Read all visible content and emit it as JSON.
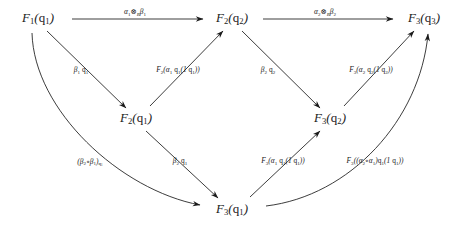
{
  "diagram": {
    "type": "commutative-diagram",
    "background_color": "#ffffff",
    "ink_color": "#1a1a1a",
    "nodes": [
      {
        "id": "n-f1q1",
        "label": "F₁(q₁)",
        "x": 38,
        "y": 18,
        "row": "top"
      },
      {
        "id": "n-f2q2",
        "label": "F₂(q₂)",
        "x": 232,
        "y": 18,
        "row": "top"
      },
      {
        "id": "n-f3q3",
        "label": "F₃(q₃)",
        "x": 424,
        "y": 18,
        "row": "top"
      },
      {
        "id": "n-f2q1",
        "label": "F₂(q₁)",
        "x": 136,
        "y": 118,
        "row": "middle"
      },
      {
        "id": "n-f3q2",
        "label": "F₃(q₂)",
        "x": 330,
        "y": 118,
        "row": "middle"
      },
      {
        "id": "n-f3q1",
        "label": "F₃(q₁)",
        "x": 232,
        "y": 209,
        "row": "bottom"
      }
    ],
    "arrows": [
      {
        "id": "a-top-left",
        "from": "F₁(q₁)",
        "to": "F₂(q₂)",
        "label": "α₁⊗ₘβ₁",
        "label_x": 135,
        "label_y": 12,
        "shape": "straight-horizontal"
      },
      {
        "id": "a-top-right",
        "from": "F₂(q₂)",
        "to": "F₃(q₃)",
        "label": "α₂⊗ₘβ₂",
        "label_x": 325,
        "label_y": 12,
        "shape": "straight-horizontal"
      },
      {
        "id": "a-f1q1-f2q1",
        "from": "F₁(q₁)",
        "to": "F₂(q₁)",
        "label": "β₁ q₁",
        "label_x": 81,
        "label_y": 70,
        "shape": "straight-diagonal"
      },
      {
        "id": "a-f2q1-f2q2",
        "from": "F₂(q₁)",
        "to": "F₂(q₂)",
        "label": "F₂(α₁ q₁(1 q₁))",
        "label_x": 178,
        "label_y": 70,
        "shape": "straight-diagonal"
      },
      {
        "id": "a-f2q2-f3q2",
        "from": "F₂(q₂)",
        "to": "F₃(q₂)",
        "label": "β₂ q₂",
        "label_x": 268,
        "label_y": 70,
        "shape": "straight-diagonal"
      },
      {
        "id": "a-f3q2-f3q3",
        "from": "F₃(q₂)",
        "to": "F₃(q₃)",
        "label": "F₃(α₂ q₂(1 q₂))",
        "label_x": 371,
        "label_y": 70,
        "shape": "straight-diagonal"
      },
      {
        "id": "a-f1q1-f3q1",
        "from": "F₁(q₁)",
        "to": "F₃(q₁)",
        "label": "(β₂∘β₁) q₁",
        "label_x": 90,
        "label_y": 162,
        "shape": "curve"
      },
      {
        "id": "a-f2q1-f3q1",
        "from": "F₂(q₁)",
        "to": "F₃(q₁)",
        "label": "β₂ q₁",
        "label_x": 180,
        "label_y": 161,
        "shape": "straight-diagonal"
      },
      {
        "id": "a-f3q1-f3q2",
        "from": "F₃(q₁)",
        "to": "F₃(q₂)",
        "label": "F₃(α₁ q₁(1 q₁))",
        "label_x": 283,
        "label_y": 161,
        "shape": "straight-diagonal"
      },
      {
        "id": "a-f3q1-f3q3",
        "from": "F₃(q₁)",
        "to": "F₃(q₃)",
        "label": "F₃((α₂∘α₁)q₁(1 q₁))",
        "label_x": 375,
        "label_y": 161,
        "shape": "curve"
      }
    ]
  }
}
